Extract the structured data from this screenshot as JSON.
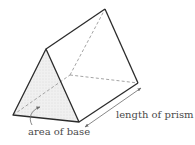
{
  "diagram": {
    "labels": {
      "area_of_base": "area of base",
      "length_of_prism": "length of prism"
    },
    "colors": {
      "edge": "#2b2b2b",
      "hidden_edge": "#9a9a9a",
      "base_fill": "#eeeeee",
      "arrow": "#6a6a6a",
      "text": "#4a4a4a"
    }
  }
}
